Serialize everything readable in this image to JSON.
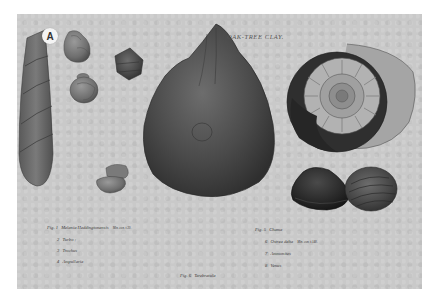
{
  "plate": {
    "badge": "A",
    "title": "OAK-TREE CLAY.",
    "background_color": "#c9c9c9",
    "captions_left": [
      {
        "num": "Fig. 1",
        "text": "Melania Heddingtonensis",
        "author": "Min. con. t.39."
      },
      {
        "num": "2",
        "text": "Turbo ;"
      },
      {
        "num": "3",
        "text": "Trochus"
      },
      {
        "num": "4",
        "text": "Ampullaria"
      }
    ],
    "caption_center": {
      "num": "Fig. 6",
      "text": "Terebratula"
    },
    "captions_right": [
      {
        "num": "Fig. 5",
        "text": "Chama"
      },
      {
        "num": "6",
        "text": "Ostrea delta",
        "author": "Min. con. t.148."
      },
      {
        "num": "7",
        "text": "Ammonites"
      },
      {
        "num": "8",
        "text": "Venus"
      }
    ],
    "specimens": [
      {
        "id": 1,
        "name": "melania-shell"
      },
      {
        "id": 2,
        "name": "turbo-shell"
      },
      {
        "id": 3,
        "name": "trochus-shell"
      },
      {
        "id": 4,
        "name": "ampullaria-shell"
      },
      {
        "id": 5,
        "name": "chama-shell"
      },
      {
        "id": 6,
        "name": "ostrea-shell"
      },
      {
        "id": 7,
        "name": "ammonite-shell"
      },
      {
        "id": 8,
        "name": "venus-shell"
      }
    ]
  }
}
